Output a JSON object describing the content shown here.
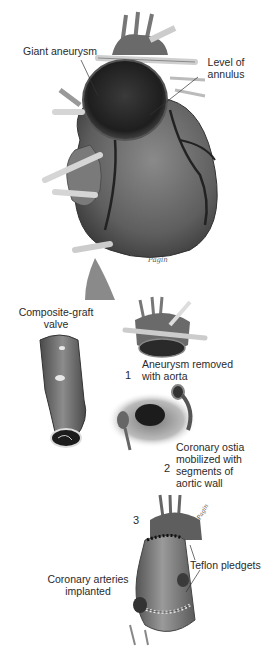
{
  "figure": {
    "panel_top": {
      "labels": {
        "giant_aneurysm": "Giant aneurysm",
        "level_of_annulus_line1": "Level of",
        "level_of_annulus_line2": "annulus"
      },
      "signature": "Pagin"
    },
    "panel_steps": {
      "composite_graft_line1": "Composite-graft",
      "composite_graft_line2": "valve",
      "step1": {
        "number": "1",
        "text_line1": "Aneurysm removed",
        "text_line2": "with aorta"
      },
      "step2": {
        "number": "2",
        "text_line1": "Coronary ostia",
        "text_line2": "mobilized with",
        "text_line3": "segments of",
        "text_line4": "aortic wall"
      },
      "step3": {
        "number": "3",
        "teflon_pledgets": "Teflon pledgets",
        "coronary_line1": "Coronary arteries",
        "coronary_line2": "implanted"
      }
    },
    "colors": {
      "tissue_dark": "#2b2b2b",
      "tissue_mid": "#6e6e6e",
      "tissue_light": "#a8a8a8",
      "vessel_light": "#d8d8d8",
      "background": "#ffffff"
    }
  }
}
